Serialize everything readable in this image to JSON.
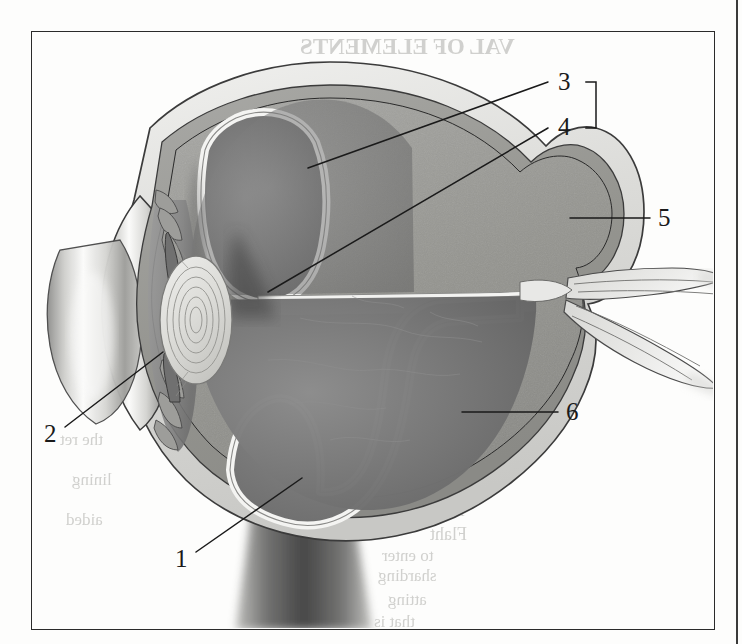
{
  "figure": {
    "type": "anatomical-cross-section",
    "rendering": "grayscale halftone scan of printed textbook page",
    "frame": {
      "border_color": "#2a2a2a",
      "x": 31,
      "y": 31,
      "width": 684,
      "height": 599
    }
  },
  "labels": [
    {
      "id": "1",
      "text": "1",
      "x": 175,
      "y": 546,
      "leader": {
        "from": [
          196,
          552
        ],
        "to": [
          302,
          478
        ]
      }
    },
    {
      "id": "2",
      "text": "2",
      "x": 44,
      "y": 421,
      "leader": {
        "from": [
          65,
          427
        ],
        "to": [
          163,
          352
        ]
      }
    },
    {
      "id": "3",
      "text": "3",
      "x": 558,
      "y": 69,
      "leader": {
        "from": [
          548,
          82
        ],
        "to": [
          308,
          168
        ]
      }
    },
    {
      "id": "4",
      "text": "4",
      "x": 558,
      "y": 114,
      "leader": {
        "from": [
          548,
          128
        ],
        "to": [
          268,
          292
        ]
      }
    },
    {
      "id": "5",
      "text": "5",
      "x": 658,
      "y": 205,
      "leader": {
        "from": [
          650,
          218
        ],
        "to": [
          570,
          218
        ]
      }
    },
    {
      "id": "6",
      "text": "6",
      "x": 566,
      "y": 399,
      "leader": {
        "from": [
          558,
          412
        ],
        "to": [
          462,
          412
        ]
      }
    }
  ],
  "bracket": {
    "name": "labels-3-4-bracket",
    "x": 596,
    "top_y": 82,
    "bottom_y": 128,
    "arm": 10,
    "color": "#1a1a1a",
    "groups": [
      "3",
      "4"
    ]
  },
  "palette": {
    "sclera_outer": "#d8d8d4",
    "sclera_light": "#ececeb",
    "choroid_mid": "#9b9b99",
    "choroid_dark": "#3c3c3c",
    "vitreous_gray": "#6e6e6e",
    "vitreous_light": "#858585",
    "retina_highlight": "#f2f2f0",
    "subretinal_dark": "#2e2e2e",
    "cornea_light": "#f6f6f5",
    "lens_fill": "#dcdcd9",
    "outline": "#3a3a3a",
    "label_text": "#1a1a1a",
    "page_background": "#fdfdfc",
    "showthrough_text": "#c9c9c6"
  },
  "showthrough": [
    {
      "text": "VAL OF ELEMENTS",
      "x": 300,
      "y": 34,
      "size": 23,
      "weight": "bold"
    },
    {
      "text": "to not the lower to",
      "x": 300,
      "y": 100,
      "size": 19
    },
    {
      "text": "installation the layers",
      "x": 288,
      "y": 128,
      "size": 19
    },
    {
      "text": "lomatic",
      "x": 430,
      "y": 156,
      "size": 18
    },
    {
      "text": "KEN",
      "x": 470,
      "y": 225,
      "size": 22,
      "weight": "bold"
    },
    {
      "text": "A tear in",
      "x": 400,
      "y": 398,
      "size": 18
    },
    {
      "text": "nsidederm",
      "x": 420,
      "y": 424,
      "size": 18
    },
    {
      "text": "explain",
      "x": 440,
      "y": 452,
      "size": 17
    },
    {
      "text": "orbit",
      "x": 455,
      "y": 478,
      "size": 17
    },
    {
      "text": "A part",
      "x": 420,
      "y": 500,
      "size": 18
    },
    {
      "text": "Flaht",
      "x": 430,
      "y": 524,
      "size": 18
    },
    {
      "text": "to enter",
      "x": 382,
      "y": 546,
      "size": 17
    },
    {
      "text": "sharding",
      "x": 378,
      "y": 566,
      "size": 17
    },
    {
      "text": "atting",
      "x": 388,
      "y": 590,
      "size": 17
    },
    {
      "text": "that is",
      "x": 374,
      "y": 612,
      "size": 17
    },
    {
      "text": "the ret",
      "x": 60,
      "y": 430,
      "size": 17
    },
    {
      "text": "lining",
      "x": 72,
      "y": 470,
      "size": 17
    },
    {
      "text": "aided",
      "x": 66,
      "y": 510,
      "size": 17
    }
  ]
}
